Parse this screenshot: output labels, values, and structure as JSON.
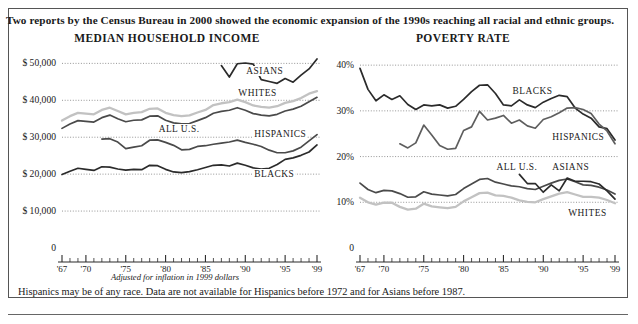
{
  "headline": "Two reports by the Census Bureau in 2000 showed the economic expansion of the 1990s reaching all racial and ethnic groups.",
  "notes": {
    "inflation": "Adjusted for inflation in 1999 dollars",
    "footnote": "Hispanics may be of any race. Data are not available for Hispanics before 1972 and for Asians before 1987."
  },
  "colors": {
    "dark": "#2b2b2b",
    "mid": "#5e5e5e",
    "light": "#c2c2c2",
    "grid": "#8a8a8a",
    "axis": "#2b2b2b",
    "background": "#ffffff"
  },
  "chart_data": [
    {
      "type": "line",
      "title": "MEDIAN HOUSEHOLD INCOME",
      "xlabel": "",
      "ylabel": "",
      "xlim": [
        1967,
        1999
      ],
      "ylim": [
        0,
        52000
      ],
      "grid": true,
      "legend_position": "inline-labels",
      "ytick_labels": [
        "$ 50,000",
        "$ 40,000",
        "$ 30,000",
        "$ 20,000",
        "$ 10,000",
        "0"
      ],
      "ytick_values": [
        50000,
        40000,
        30000,
        20000,
        10000,
        0
      ],
      "xtick_labels": [
        "'67",
        "'70",
        "'75",
        "'80",
        "'85",
        "'90",
        "'95",
        "'99"
      ],
      "xtick_values": [
        1967,
        1970,
        1975,
        1980,
        1985,
        1990,
        1995,
        1999
      ],
      "series": [
        {
          "name": "ASIANS",
          "color": "#2b2b2b",
          "x": [
            1987,
            1988,
            1989,
            1990,
            1991,
            1992,
            1993,
            1994,
            1995,
            1996,
            1997,
            1998,
            1999
          ],
          "values": [
            49400,
            46300,
            49900,
            50100,
            49800,
            45600,
            45100,
            44600,
            45900,
            44900,
            46800,
            48500,
            51200
          ]
        },
        {
          "name": "WHITES",
          "color": "#c2c2c2",
          "x": [
            1967,
            1968,
            1969,
            1970,
            1971,
            1972,
            1973,
            1974,
            1975,
            1976,
            1977,
            1978,
            1979,
            1980,
            1981,
            1982,
            1983,
            1984,
            1985,
            1986,
            1987,
            1988,
            1989,
            1990,
            1991,
            1992,
            1993,
            1994,
            1995,
            1996,
            1997,
            1998,
            1999
          ],
          "values": [
            34500,
            35700,
            36600,
            36400,
            36200,
            37400,
            38000,
            37100,
            36200,
            36600,
            36800,
            37700,
            37800,
            36600,
            36000,
            35700,
            35900,
            36700,
            37400,
            38700,
            39200,
            39500,
            40200,
            39500,
            38600,
            38200,
            38000,
            38400,
            39300,
            39800,
            40600,
            41800,
            42500
          ]
        },
        {
          "name": "ALL U.S.",
          "color": "#4a4a4a",
          "x": [
            1967,
            1968,
            1969,
            1970,
            1971,
            1972,
            1973,
            1974,
            1975,
            1976,
            1977,
            1978,
            1979,
            1980,
            1981,
            1982,
            1983,
            1984,
            1985,
            1986,
            1987,
            1988,
            1989,
            1990,
            1991,
            1992,
            1993,
            1994,
            1995,
            1996,
            1997,
            1998,
            1999
          ],
          "values": [
            32400,
            33600,
            34500,
            34300,
            34100,
            35300,
            36000,
            35000,
            34200,
            34600,
            34700,
            35700,
            35800,
            34600,
            33900,
            33600,
            33700,
            34500,
            35300,
            36500,
            37000,
            37300,
            38000,
            37300,
            36400,
            36000,
            35800,
            36200,
            37100,
            37600,
            38400,
            39600,
            40800
          ]
        },
        {
          "name": "HISPANICS",
          "color": "#4a4a4a",
          "x": [
            1972,
            1973,
            1974,
            1975,
            1976,
            1977,
            1978,
            1979,
            1980,
            1981,
            1982,
            1983,
            1984,
            1985,
            1986,
            1987,
            1988,
            1989,
            1990,
            1991,
            1992,
            1993,
            1994,
            1995,
            1996,
            1997,
            1998,
            1999
          ],
          "values": [
            29500,
            29600,
            28700,
            26900,
            27300,
            27700,
            29200,
            29300,
            28600,
            27800,
            26600,
            26700,
            27500,
            27700,
            28100,
            28400,
            28700,
            29200,
            28600,
            28100,
            27500,
            26500,
            25800,
            25800,
            26300,
            27300,
            29000,
            30700
          ]
        },
        {
          "name": "BLACKS",
          "color": "#2b2b2b",
          "x": [
            1967,
            1968,
            1969,
            1970,
            1971,
            1972,
            1973,
            1974,
            1975,
            1976,
            1977,
            1978,
            1979,
            1980,
            1981,
            1982,
            1983,
            1984,
            1985,
            1986,
            1987,
            1988,
            1989,
            1990,
            1991,
            1992,
            1993,
            1994,
            1995,
            1996,
            1997,
            1998,
            1999
          ],
          "values": [
            19900,
            20800,
            21600,
            21300,
            21000,
            22000,
            21900,
            21400,
            21100,
            21300,
            21200,
            22400,
            22300,
            21300,
            20600,
            20400,
            20700,
            21200,
            21800,
            22400,
            22500,
            22200,
            23000,
            22400,
            21700,
            21400,
            21600,
            22600,
            24000,
            24400,
            25100,
            26000,
            27900
          ]
        }
      ]
    },
    {
      "type": "line",
      "title": "POVERTY RATE",
      "xlabel": "",
      "ylabel": "",
      "xlim": [
        1967,
        1999
      ],
      "ylim": [
        0,
        42
      ],
      "grid": true,
      "legend_position": "inline-labels",
      "ytick_labels": [
        "40%",
        "30%",
        "20%",
        "10%",
        "0"
      ],
      "ytick_values": [
        40,
        30,
        20,
        10,
        0
      ],
      "xtick_labels": [
        "'67",
        "'70",
        "'75",
        "'80",
        "'85",
        "'90",
        "'95",
        "'99"
      ],
      "xtick_values": [
        1967,
        1970,
        1975,
        1980,
        1985,
        1990,
        1995,
        1999
      ],
      "series": [
        {
          "name": "BLACKS",
          "color": "#2b2b2b",
          "x": [
            1967,
            1968,
            1969,
            1970,
            1971,
            1972,
            1973,
            1974,
            1975,
            1976,
            1977,
            1978,
            1979,
            1980,
            1981,
            1982,
            1983,
            1984,
            1985,
            1986,
            1987,
            1988,
            1989,
            1990,
            1991,
            1992,
            1993,
            1994,
            1995,
            1996,
            1997,
            1998,
            1999
          ],
          "values": [
            39.3,
            34.7,
            32.2,
            33.5,
            32.5,
            33.3,
            31.4,
            30.3,
            31.3,
            31.1,
            31.3,
            30.6,
            31.0,
            32.5,
            34.2,
            35.6,
            35.7,
            33.8,
            31.3,
            31.1,
            32.4,
            31.3,
            30.7,
            31.9,
            32.7,
            33.4,
            33.1,
            30.6,
            29.3,
            28.4,
            26.5,
            26.1,
            23.6
          ]
        },
        {
          "name": "HISPANICS",
          "color": "#5e5e5e",
          "x": [
            1972,
            1973,
            1974,
            1975,
            1976,
            1977,
            1978,
            1979,
            1980,
            1981,
            1982,
            1983,
            1984,
            1985,
            1986,
            1987,
            1988,
            1989,
            1990,
            1991,
            1992,
            1993,
            1994,
            1995,
            1996,
            1997,
            1998,
            1999
          ],
          "values": [
            22.8,
            21.9,
            23.0,
            26.9,
            24.7,
            22.4,
            21.6,
            21.8,
            25.7,
            26.5,
            29.9,
            28.0,
            28.4,
            29.0,
            27.3,
            28.0,
            26.7,
            26.2,
            28.1,
            28.7,
            29.6,
            30.6,
            30.7,
            30.3,
            29.4,
            27.1,
            25.6,
            22.8
          ]
        },
        {
          "name": "ALL U.S.",
          "color": "#4a4a4a",
          "x": [
            1967,
            1968,
            1969,
            1970,
            1971,
            1972,
            1973,
            1974,
            1975,
            1976,
            1977,
            1978,
            1979,
            1980,
            1981,
            1982,
            1983,
            1984,
            1985,
            1986,
            1987,
            1988,
            1989,
            1990,
            1991,
            1992,
            1993,
            1994,
            1995,
            1996,
            1997,
            1998,
            1999
          ],
          "values": [
            14.2,
            12.8,
            12.1,
            12.6,
            12.5,
            11.9,
            11.1,
            11.2,
            12.3,
            11.8,
            11.6,
            11.4,
            11.7,
            13.0,
            14.0,
            15.0,
            15.2,
            14.4,
            14.0,
            13.6,
            13.4,
            13.0,
            12.8,
            13.5,
            14.2,
            14.8,
            15.1,
            14.5,
            13.8,
            13.7,
            13.3,
            12.7,
            11.8
          ]
        },
        {
          "name": "ASIANS",
          "color": "#2b2b2b",
          "x": [
            1987,
            1988,
            1989,
            1990,
            1991,
            1992,
            1993,
            1994,
            1995,
            1996,
            1997,
            1998,
            1999
          ],
          "values": [
            16.1,
            14.1,
            14.1,
            12.2,
            13.8,
            12.5,
            15.3,
            14.6,
            14.6,
            14.5,
            14.0,
            12.5,
            10.7
          ]
        },
        {
          "name": "WHITES",
          "color": "#c2c2c2",
          "x": [
            1967,
            1968,
            1969,
            1970,
            1971,
            1972,
            1973,
            1974,
            1975,
            1976,
            1977,
            1978,
            1979,
            1980,
            1981,
            1982,
            1983,
            1984,
            1985,
            1986,
            1987,
            1988,
            1989,
            1990,
            1991,
            1992,
            1993,
            1994,
            1995,
            1996,
            1997,
            1998,
            1999
          ],
          "values": [
            11.0,
            10.0,
            9.5,
            9.9,
            9.9,
            9.0,
            8.4,
            8.6,
            9.7,
            9.1,
            8.9,
            8.7,
            9.0,
            10.2,
            11.1,
            12.0,
            12.1,
            11.5,
            11.4,
            11.0,
            10.4,
            10.1,
            10.0,
            10.7,
            11.3,
            11.9,
            12.2,
            11.7,
            11.2,
            11.2,
            11.0,
            10.5,
            9.8
          ]
        }
      ],
      "series_labels": [
        {
          "name": "BLACKS",
          "x": 1986,
          "y": 34.0
        },
        {
          "name": "HISPANICS",
          "x": 1991,
          "y": 23.9
        },
        {
          "name": "ALL U.S.",
          "x": 1984,
          "y": 17.2
        },
        {
          "name": "ASIANS",
          "x": 1991,
          "y": 17.2
        },
        {
          "name": "WHITES",
          "x": 1993,
          "y": 7.3
        }
      ]
    }
  ],
  "income_series_labels": [
    {
      "name": "ASIANS",
      "x": 1990,
      "y": 47400
    },
    {
      "name": "WHITES",
      "x": 1989,
      "y": 41500
    },
    {
      "name": "ALL U.S.",
      "x": 1979,
      "y": 31600
    },
    {
      "name": "HISPANICS",
      "x": 1991,
      "y": 30300
    },
    {
      "name": "BLACKS",
      "x": 1991,
      "y": 19600
    }
  ]
}
